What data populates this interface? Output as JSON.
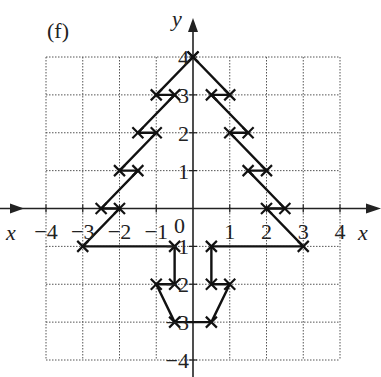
{
  "figure": {
    "label": "(f)",
    "x_axis_label": "x",
    "y_axis_label": "y",
    "colors": {
      "grid": "#555555",
      "axis": "#222222",
      "shape": "#111111",
      "background": "#ffffff"
    }
  },
  "chart_data": {
    "type": "line",
    "title": "(f)",
    "xlabel": "x",
    "ylabel": "y",
    "xlim": [
      -4,
      4
    ],
    "ylim": [
      -4,
      4
    ],
    "grid": true,
    "x_ticks": [
      -4,
      -3,
      -2,
      -1,
      0,
      1,
      2,
      3,
      4
    ],
    "y_ticks": [
      -4,
      -3,
      -2,
      -1,
      1,
      2,
      3,
      4
    ],
    "x_tick_labels": [
      "−4",
      "−3",
      "−2",
      "−1",
      "0",
      "1",
      "2",
      "3",
      "4"
    ],
    "y_tick_labels": [
      "−4",
      "−3",
      "−2",
      "−1",
      "1",
      "2",
      "3",
      "4"
    ],
    "series": [
      {
        "name": "tree-outline",
        "marker": "x",
        "closed": true,
        "points": [
          [
            0,
            4
          ],
          [
            -1,
            3
          ],
          [
            -0.5,
            3
          ],
          [
            -1.5,
            2
          ],
          [
            -1,
            2
          ],
          [
            -2,
            1
          ],
          [
            -1.5,
            1
          ],
          [
            -2.5,
            0
          ],
          [
            -2,
            0
          ],
          [
            -3,
            -1
          ],
          [
            -0.5,
            -1
          ],
          [
            -0.5,
            -2
          ],
          [
            -1,
            -2
          ],
          [
            -0.5,
            -3
          ],
          [
            0.5,
            -3
          ],
          [
            1,
            -2
          ],
          [
            0.5,
            -2
          ],
          [
            0.5,
            -1
          ],
          [
            3,
            -1
          ],
          [
            2,
            0
          ],
          [
            2.5,
            0
          ],
          [
            1.5,
            1
          ],
          [
            2,
            1
          ],
          [
            1,
            2
          ],
          [
            1.5,
            2
          ],
          [
            0.5,
            3
          ],
          [
            1,
            3
          ],
          [
            0,
            4
          ]
        ]
      }
    ]
  }
}
